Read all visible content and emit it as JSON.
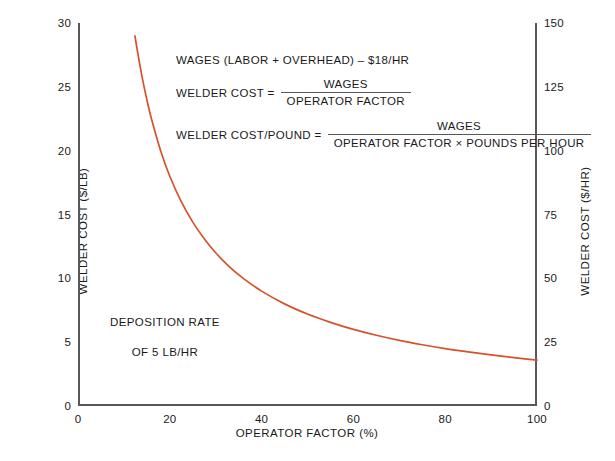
{
  "chart_data": {
    "type": "line",
    "title": "",
    "xlabel": "OPERATOR FACTOR (%)",
    "ylabel": "WELDER COST ($/LB)",
    "ylabel_secondary": "WELDER COST ($/HR)",
    "xlim": [
      0,
      100
    ],
    "ylim": [
      0,
      30
    ],
    "ylim_secondary": [
      0,
      150
    ],
    "grid": false,
    "legend": "none",
    "xticks": [
      "0",
      "20",
      "40",
      "60",
      "80",
      "100"
    ],
    "xtick_values": [
      0,
      20,
      40,
      60,
      80,
      100
    ],
    "yticks_left": [
      "0",
      "5",
      "10",
      "15",
      "20",
      "25",
      "30"
    ],
    "ytick_values_left": [
      0,
      5,
      10,
      15,
      20,
      25,
      30
    ],
    "yticks_right": [
      "0",
      "25",
      "50",
      "75",
      "100",
      "125",
      "150"
    ],
    "ytick_values_right": [
      0,
      25,
      50,
      75,
      100,
      125,
      150
    ],
    "series": [
      {
        "name": "Welder cost vs operator factor",
        "color": "#d4532b",
        "x": [
          12.4,
          13,
          14,
          15,
          16,
          18,
          20,
          22.5,
          25,
          27.5,
          30,
          33,
          36,
          40,
          45,
          50,
          55,
          60,
          65,
          70,
          75,
          80,
          85,
          90,
          95,
          100
        ],
        "y": [
          29.0,
          27.7,
          25.7,
          24.0,
          22.5,
          20.0,
          18.0,
          16.0,
          14.4,
          13.1,
          12.0,
          10.9,
          10.0,
          9.0,
          8.0,
          7.2,
          6.55,
          6.0,
          5.54,
          5.14,
          4.8,
          4.5,
          4.24,
          4.0,
          3.79,
          3.6
        ],
        "y_secondary": [
          145,
          138.5,
          128.5,
          120,
          112.5,
          100,
          90,
          80,
          72,
          65.5,
          60,
          54.5,
          50,
          45,
          40,
          36,
          32.75,
          30,
          27.7,
          25.7,
          24,
          22.5,
          21.2,
          20,
          18.95,
          18
        ]
      }
    ],
    "annotations": [
      {
        "name": "deposition-note",
        "text": "DEPOSITION RATE\nOF 5 LB/HR"
      },
      {
        "name": "wages-definition",
        "text": "WAGES (LABOR + OVERHEAD) – $18/HR"
      }
    ]
  },
  "formulas": {
    "wages_line": "WAGES (LABOR + OVERHEAD) – $18/HR",
    "welder_cost": {
      "lhs": "WELDER COST  =",
      "numerator": "WAGES",
      "denominator": "OPERATOR FACTOR"
    },
    "welder_cost_per_pound": {
      "lhs": "WELDER COST/POUND  =",
      "numerator": "WAGES",
      "denominator": "OPERATOR FACTOR × POUNDS PER HOUR"
    }
  },
  "notes": {
    "deposition_line1": "DEPOSITION RATE",
    "deposition_line2": "OF 5 LB/HR"
  },
  "colors": {
    "curve": "#d4532b",
    "axis": "#58585a",
    "text": "#1a1a1a",
    "background": "#ffffff"
  }
}
